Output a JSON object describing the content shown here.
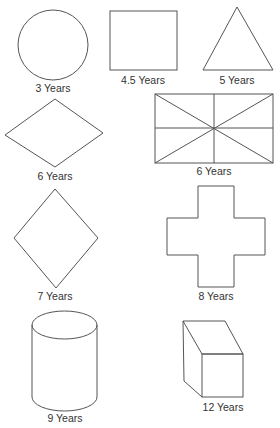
{
  "figure": {
    "shapes": [
      {
        "shape": "circle",
        "label": "3 Years"
      },
      {
        "shape": "square",
        "label": "4.5 Years"
      },
      {
        "shape": "triangle",
        "label": "5 Years"
      },
      {
        "shape": "horizontal-rhombus",
        "label": "6 Years"
      },
      {
        "shape": "divided-rectangle",
        "label": "6 Years"
      },
      {
        "shape": "vertical-diamond",
        "label": "7 Years"
      },
      {
        "shape": "cross",
        "label": "8 Years"
      },
      {
        "shape": "cylinder",
        "label": "9 Years"
      },
      {
        "shape": "rectangular-prism",
        "label": "12 Years"
      }
    ],
    "colors": {
      "stroke": "#555555",
      "text": "#333333",
      "background": "#ffffff"
    }
  }
}
